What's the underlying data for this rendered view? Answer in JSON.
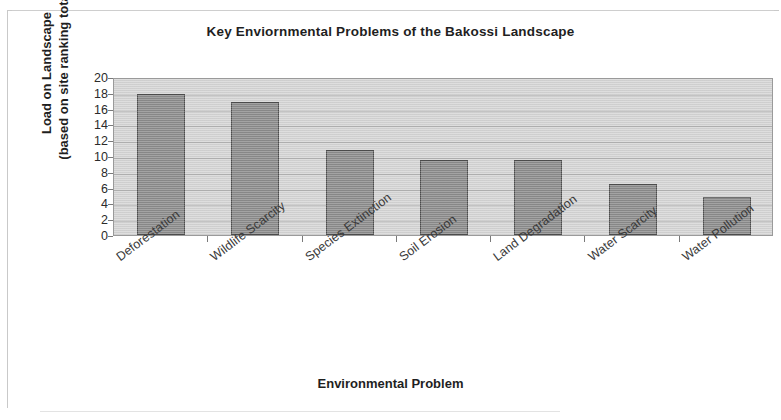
{
  "chart_data": {
    "type": "bar",
    "title": "Key Enviornmental Problems of the Bakossi Landscape",
    "xlabel": "Environmental Problem",
    "ylabel_line1": "Load on Landscape",
    "ylabel_line2": "(based on site ranking total)",
    "categories": [
      "Deforestation",
      "Wildlife Scarcity",
      "Species Extinction",
      "Soil Erosion",
      "Land Degradation",
      "Water Scarcity",
      "Water Pollution"
    ],
    "values": [
      17.8,
      16.8,
      10.7,
      9.5,
      9.5,
      6.5,
      4.8
    ],
    "ylim": [
      0,
      20
    ],
    "ytick_labels": [
      "20",
      "18",
      "16",
      "14",
      "12",
      "10",
      "8",
      "6",
      "4",
      "2",
      "0"
    ],
    "ytick_values": [
      20,
      18,
      16,
      14,
      12,
      10,
      8,
      6,
      4,
      2,
      0
    ],
    "grid": true,
    "legend": false,
    "bar_color": "#8c8c8c",
    "bar_border_color": "#4e4e4e",
    "plot_background": "#d6d6d6"
  }
}
